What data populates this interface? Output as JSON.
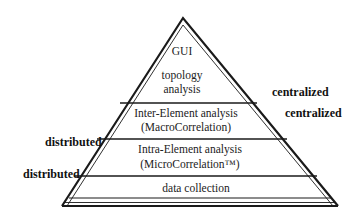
{
  "diagram": {
    "type": "pyramid",
    "layers": [
      {
        "id": "gui",
        "lines": [
          "GUI"
        ]
      },
      {
        "id": "topology",
        "lines": [
          "topology",
          "analysis"
        ]
      },
      {
        "id": "inter",
        "lines": [
          "Inter-Element analysis",
          "(MacroCorrelation)"
        ]
      },
      {
        "id": "intra",
        "lines": [
          "Intra-Element analysis",
          "(MicroCorrelation™)"
        ]
      },
      {
        "id": "collection",
        "lines": [
          "data collection"
        ]
      }
    ],
    "right_labels": [
      "centralized",
      "centralized"
    ],
    "left_labels": [
      "distributed",
      "distributed"
    ],
    "colors": {
      "line": "#1a1a1a",
      "background": "#ffffff"
    }
  }
}
